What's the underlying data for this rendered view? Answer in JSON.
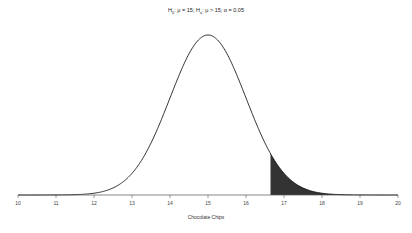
{
  "chart_data": {
    "type": "area",
    "title": "H0: μ = 15; Ha: μ > 15; α = 0.05",
    "title_parts": {
      "h0_label": "H",
      "h0_sub": "0",
      "h0_text": ": μ = 15; ",
      "ha_label": "H",
      "ha_sub": "a",
      "ha_text": ": μ > 15; α = 0.05"
    },
    "xlabel": "Chocolate Chips",
    "ylabel": "",
    "xlim": [
      10,
      20
    ],
    "x_ticks": [
      10,
      11,
      12,
      13,
      14,
      15,
      16,
      17,
      18,
      19,
      20
    ],
    "x_tick_labels": [
      "10",
      "11",
      "12",
      "13",
      "14",
      "15",
      "16",
      "17",
      "18",
      "19",
      "20"
    ],
    "grid": false,
    "legend": "none",
    "distribution": {
      "name": "normal",
      "mean": 15,
      "sd": 1.0
    },
    "shaded_region": {
      "from": 16.645,
      "to": 20,
      "tail": "right",
      "area": 0.05,
      "color": "#333333"
    },
    "curve_color": "#000000"
  }
}
